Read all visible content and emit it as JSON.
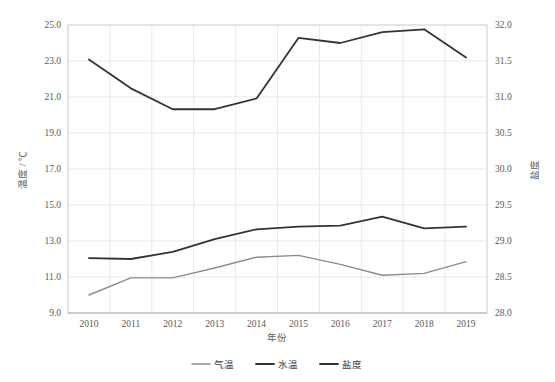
{
  "chart_data": {
    "type": "line",
    "title": "",
    "xlabel": "年份",
    "ylabel": "温度 / ℃",
    "y2label": "盐度",
    "categories": [
      "2010",
      "2011",
      "2012",
      "2013",
      "2014",
      "2015",
      "2016",
      "2017",
      "2018",
      "2019"
    ],
    "x": [
      2010,
      2011,
      2012,
      2013,
      2014,
      2015,
      2016,
      2017,
      2018,
      2019
    ],
    "ylim": [
      9.0,
      25.0
    ],
    "y2lim": [
      28.0,
      32.0
    ],
    "ytick_step": 2.0,
    "y2tick_step": 0.5,
    "yticks": [
      "9.0",
      "11.0",
      "13.0",
      "15.0",
      "17.0",
      "19.0",
      "21.0",
      "23.0",
      "25.0"
    ],
    "y2ticks": [
      "28.0",
      "28.5",
      "29.0",
      "29.5",
      "30.0",
      "30.5",
      "31.0",
      "31.5",
      "32.0"
    ],
    "grid": true,
    "legend_position": "bottom",
    "series": [
      {
        "name": "气温",
        "axis": "left",
        "color": "#8c8c8c",
        "width": 1.4,
        "values": [
          10.0,
          10.95,
          10.95,
          11.5,
          12.1,
          12.2,
          11.7,
          11.1,
          11.2,
          11.85
        ]
      },
      {
        "name": "水温",
        "axis": "left",
        "color": "#333333",
        "width": 1.8,
        "values": [
          12.05,
          12.0,
          12.4,
          13.1,
          13.65,
          13.8,
          13.85,
          14.35,
          13.7,
          13.8
        ]
      },
      {
        "name": "盐度",
        "axis": "right",
        "color": "#333333",
        "width": 1.8,
        "values": [
          31.52,
          31.12,
          30.83,
          30.83,
          30.98,
          31.82,
          31.75,
          31.9,
          31.94,
          31.55
        ]
      }
    ]
  },
  "axes": {
    "left_title": "温度 / ℃",
    "right_title": "盐度",
    "x_title": "年份"
  },
  "legend": {
    "items": [
      {
        "label": "气温"
      },
      {
        "label": "水温"
      },
      {
        "label": "盐度"
      }
    ]
  },
  "colors": {
    "air_temp": "#8c8c8c",
    "water_temp": "#333333",
    "salinity": "#333333",
    "grid": "#e3e3e3",
    "frame": "#d0d0d0",
    "text": "#595959",
    "background": "#ffffff"
  }
}
